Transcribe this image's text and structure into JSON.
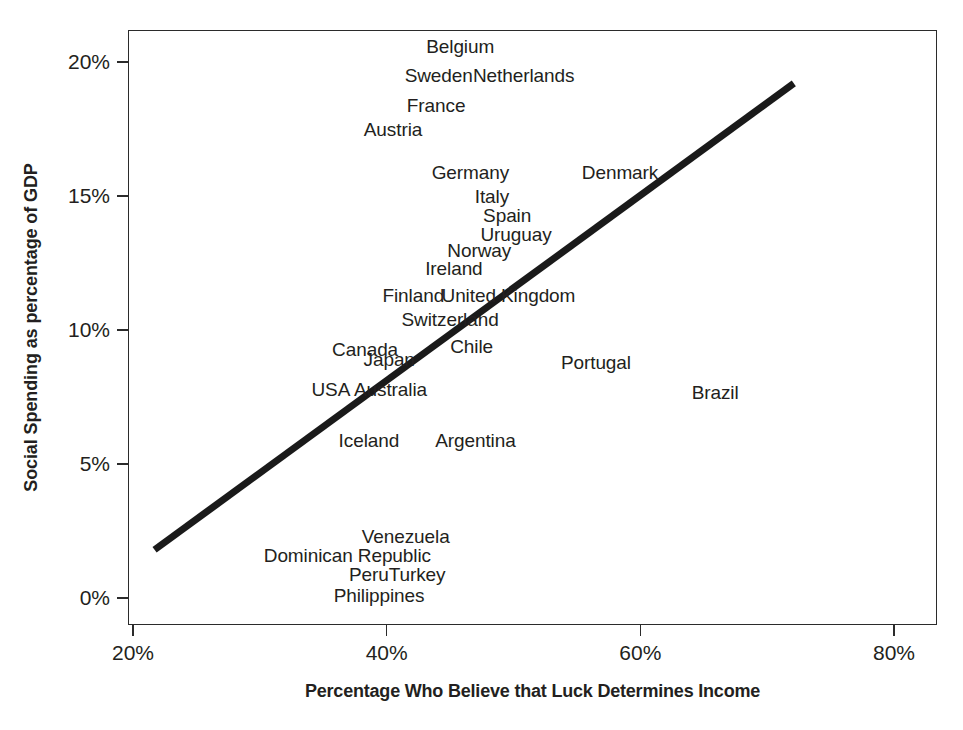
{
  "chart_data": {
    "type": "scatter",
    "title": "",
    "subtitle": "",
    "xlabel": "Percentage Who Believe that Luck Determines Income",
    "ylabel": "Social Spending as percentage of GDP",
    "xlim": [
      18.1,
      80.0
    ],
    "ylim": [
      -0.6,
      20.8
    ],
    "grid": false,
    "legend": null,
    "x_ticks": [
      "20%",
      "40%",
      "60%",
      "80%"
    ],
    "x_tick_values": [
      20,
      40,
      60,
      80
    ],
    "y_ticks": [
      "0%",
      "5%",
      "10%",
      "15%",
      "20%"
    ],
    "y_tick_values": [
      0,
      5,
      10,
      15,
      20
    ],
    "marker_style": "text-label-only",
    "points": [
      {
        "label": "Belgium",
        "x": 45.8,
        "y": 20.6
      },
      {
        "label": "Sweden",
        "x": 44.1,
        "y": 19.5
      },
      {
        "label": "Netherlands",
        "x": 50.8,
        "y": 19.5
      },
      {
        "label": "France",
        "x": 43.9,
        "y": 18.4
      },
      {
        "label": "Austria",
        "x": 40.5,
        "y": 17.5
      },
      {
        "label": "Germany",
        "x": 46.6,
        "y": 15.9
      },
      {
        "label": "Denmark",
        "x": 58.4,
        "y": 15.9
      },
      {
        "label": "Italy",
        "x": 48.3,
        "y": 15.0
      },
      {
        "label": "Spain",
        "x": 49.5,
        "y": 14.3
      },
      {
        "label": "Uruguay",
        "x": 50.2,
        "y": 13.6
      },
      {
        "label": "Norway",
        "x": 47.3,
        "y": 13.0
      },
      {
        "label": "Ireland",
        "x": 45.3,
        "y": 12.3
      },
      {
        "label": "Finland",
        "x": 42.1,
        "y": 11.3
      },
      {
        "label": "United Kingdom",
        "x": 49.6,
        "y": 11.3
      },
      {
        "label": "Switzerland",
        "x": 45.0,
        "y": 10.4
      },
      {
        "label": "Canada",
        "x": 38.3,
        "y": 9.3
      },
      {
        "label": "Chile",
        "x": 46.7,
        "y": 9.4
      },
      {
        "label": "Japan",
        "x": 40.2,
        "y": 8.9
      },
      {
        "label": "Portugal",
        "x": 56.5,
        "y": 8.8
      },
      {
        "label": "USA",
        "x": 35.6,
        "y": 7.8
      },
      {
        "label": "Australia",
        "x": 40.3,
        "y": 7.8
      },
      {
        "label": "Brazil",
        "x": 65.9,
        "y": 7.7
      },
      {
        "label": "Iceland",
        "x": 38.6,
        "y": 5.9
      },
      {
        "label": "Argentina",
        "x": 47.0,
        "y": 5.9
      },
      {
        "label": "Venezuela",
        "x": 41.5,
        "y": 2.3
      },
      {
        "label": "Dominican Republic",
        "x": 36.9,
        "y": 1.6
      },
      {
        "label": "Peru",
        "x": 38.6,
        "y": 0.9
      },
      {
        "label": "Turkey",
        "x": 42.4,
        "y": 0.9
      },
      {
        "label": "Philippines",
        "x": 39.4,
        "y": 0.1
      }
    ],
    "trend_line": {
      "style": "solid-thick-black",
      "color": "#1a1a1a",
      "width_px": 7,
      "x_start": 21.7,
      "y_start": 1.8,
      "x_end": 72.1,
      "y_end": 19.2
    }
  },
  "axes": {
    "x_title": "Percentage Who Believe that Luck Determines Income",
    "y_title": "Social Spending as percentage of GDP"
  }
}
